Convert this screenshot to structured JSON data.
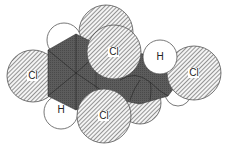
{
  "diagram": {
    "type": "space-filling molecular model",
    "colors": {
      "background": "#ffffff",
      "carbon": "#5a5a5a",
      "chlorine_hatch": "#6a6a6a",
      "hydrogen": "#ffffff",
      "outline": "#555555"
    },
    "atoms": [
      {
        "id": "cl-back-top",
        "element": "Cl",
        "label": "",
        "cx": 106,
        "cy": 32,
        "r": 27
      },
      {
        "id": "cl-back-bottom",
        "element": "Cl",
        "label": "",
        "cx": 140,
        "cy": 103,
        "r": 21
      },
      {
        "id": "h-back-right",
        "element": "H",
        "label": "",
        "cx": 178,
        "cy": 93,
        "r": 13
      },
      {
        "id": "h-top-left",
        "element": "H",
        "label": "H",
        "cx": 64,
        "cy": 40,
        "r": 17
      },
      {
        "id": "h-bottom-left",
        "element": "H",
        "label": "H",
        "cx": 61,
        "cy": 112,
        "r": 17
      },
      {
        "id": "cl-left",
        "element": "Cl",
        "label": "Cl",
        "cx": 33,
        "cy": 76,
        "r": 26
      },
      {
        "id": "cl-right",
        "element": "Cl",
        "label": "Cl",
        "cx": 194,
        "cy": 73,
        "r": 27
      },
      {
        "id": "cl-top-front",
        "element": "Cl",
        "label": "Cl",
        "cx": 114,
        "cy": 52,
        "r": 27
      },
      {
        "id": "h-right",
        "element": "H",
        "label": "H",
        "cx": 160,
        "cy": 57,
        "r": 17
      },
      {
        "id": "cl-bottom",
        "element": "Cl",
        "label": "Cl",
        "cx": 104,
        "cy": 116,
        "r": 27
      }
    ]
  }
}
